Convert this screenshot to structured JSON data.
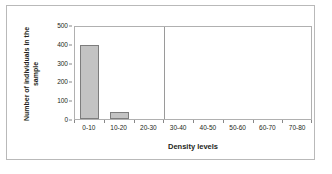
{
  "chart_data": {
    "type": "bar",
    "title": "",
    "subtitle": "",
    "xlabel": "Density levels",
    "ylabel": "Number of individuals in the sample",
    "ylabel_lines": [
      "Number of individuals in the",
      "sample"
    ],
    "categories": [
      "0-10",
      "10-20",
      "20-30",
      "30-40",
      "40-50",
      "50-60",
      "60-70",
      "70-80"
    ],
    "values": [
      395,
      35,
      0,
      0,
      0,
      0,
      0,
      0
    ],
    "ylim": [
      0,
      500
    ],
    "yticks": [
      0,
      100,
      200,
      300,
      400,
      500
    ],
    "grid": false,
    "legend": null,
    "annotations": [
      {
        "name": "vertical-divider",
        "after_category": "20-30"
      }
    ],
    "colors": {
      "bar_fill": "#c3c3c3",
      "bar_stroke": "#7d7d7d",
      "axis": "#b0b0b0",
      "text": "#231f20",
      "frame": "#b9b9b9",
      "divider": "#9a9a9a",
      "background": "#ffffff"
    }
  }
}
